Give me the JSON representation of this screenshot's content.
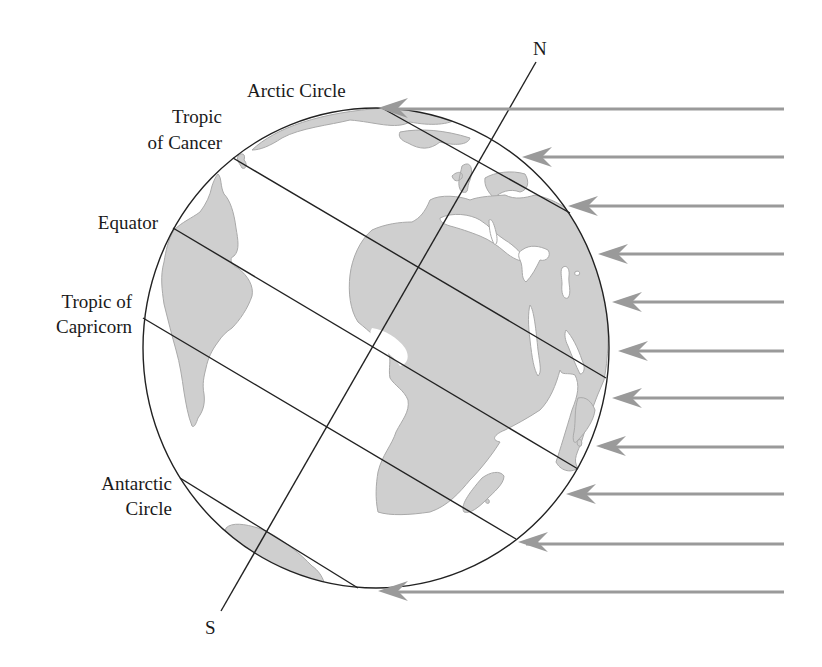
{
  "diagram": {
    "type": "earth-sunlight-tilt",
    "labels": {
      "north": "N",
      "south": "S",
      "arctic_circle": "Arctic Circle",
      "tropic_of_cancer_line1": "Tropic",
      "tropic_of_cancer_line2": "of Cancer",
      "equator": "Equator",
      "tropic_of_capricorn_line1": "Tropic of",
      "tropic_of_capricorn_line2": "Capricorn",
      "antarctic_circle_line1": "Antarctic",
      "antarctic_circle_line2": "Circle"
    },
    "sun_rays": {
      "count": 11,
      "direction": "right-to-left",
      "color": "#9a9a9a"
    },
    "colors": {
      "land": "#cfcfcf",
      "outline": "#222222",
      "background": "#ffffff"
    }
  }
}
